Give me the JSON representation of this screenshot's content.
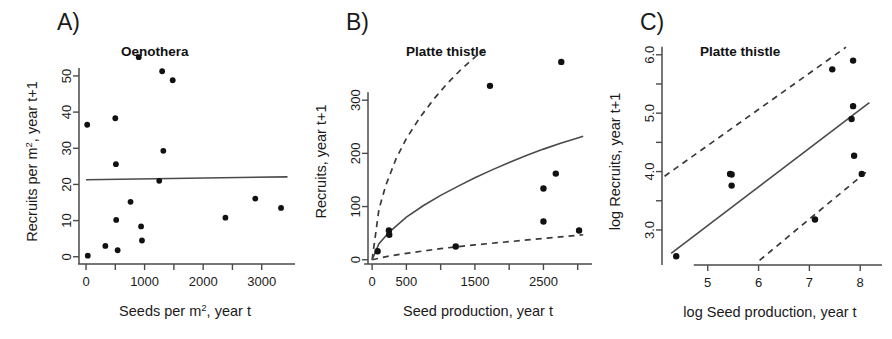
{
  "figure": {
    "name": "three-panel-recruitment-figure",
    "background": "#ffffff",
    "ink_color": "#1a1a1a"
  },
  "panels": [
    {
      "id": "A",
      "letter": "A)",
      "title": "Oenothera",
      "xlabel_pre": "Seeds per m",
      "xlabel_sup": "2",
      "xlabel_post": ", year t",
      "ylabel_pre": "Recruits per m",
      "ylabel_sup": "2",
      "ylabel_post": ", year t+1",
      "x_ticks": [
        0,
        500,
        1000,
        1500,
        2000,
        2500,
        3000
      ],
      "x_tick_labels": [
        "0",
        "",
        "1000",
        "",
        "2000",
        "",
        "3000"
      ],
      "y_ticks": [
        0,
        10,
        20,
        30,
        40,
        50
      ],
      "y_tick_labels": [
        "0",
        "10",
        "20",
        "30",
        "40",
        "50"
      ],
      "xlim": [
        -120,
        3500
      ],
      "ylim": [
        -2,
        58
      ]
    },
    {
      "id": "B",
      "letter": "B)",
      "title": "Platte thistle",
      "xlabel_pre": "Seed production, year t",
      "xlabel_sup": "",
      "xlabel_post": "",
      "ylabel_pre": "Recruits, year t+1",
      "ylabel_sup": "",
      "ylabel_post": "",
      "x_ticks": [
        0,
        500,
        1000,
        1500,
        2000,
        2500,
        3000
      ],
      "x_tick_labels": [
        "0",
        "500",
        "",
        "1500",
        "",
        "2500",
        ""
      ],
      "y_ticks": [
        0,
        100,
        200,
        300
      ],
      "y_tick_labels": [
        "0",
        "100",
        "200",
        "300"
      ],
      "xlim": [
        -60,
        3150
      ],
      "ylim": [
        -8,
        400
      ]
    },
    {
      "id": "C",
      "letter": "C)",
      "title": "Platte thistle",
      "xlabel_pre": "log Seed production, year t",
      "xlabel_sup": "",
      "xlabel_post": "",
      "ylabel_pre": "log Recruits, year t+1",
      "ylabel_sup": "",
      "ylabel_post": "",
      "x_ticks": [
        5,
        6,
        7,
        8
      ],
      "x_tick_labels": [
        "5",
        "6",
        "7",
        "8"
      ],
      "y_ticks": [
        3.0,
        3.5,
        4.0,
        4.5,
        5.0,
        5.5,
        6.0
      ],
      "y_tick_labels": [
        "3.0",
        "",
        "4.0",
        "",
        "5.0",
        "",
        "6.0"
      ],
      "xlim": [
        4.1,
        8.35
      ],
      "ylim": [
        2.4,
        6.15
      ]
    }
  ],
  "chart_data": [
    {
      "type": "scatter",
      "panel": "A",
      "title": "Oenothera",
      "xlabel": "Seeds per m2, year t",
      "ylabel": "Recruits per m2, year t+1",
      "xlim": [
        -120,
        3500
      ],
      "ylim": [
        -2,
        58
      ],
      "xticks": [
        0,
        500,
        1000,
        1500,
        2000,
        2500,
        3000
      ],
      "yticks": [
        0,
        10,
        20,
        30,
        40,
        50
      ],
      "grid": false,
      "legend": "none",
      "points": [
        {
          "x": 20,
          "y": 36.5
        },
        {
          "x": 30,
          "y": 0.3
        },
        {
          "x": 330,
          "y": 3.0
        },
        {
          "x": 500,
          "y": 38.3
        },
        {
          "x": 510,
          "y": 25.6
        },
        {
          "x": 515,
          "y": 10.2
        },
        {
          "x": 540,
          "y": 1.8
        },
        {
          "x": 760,
          "y": 15.2
        },
        {
          "x": 900,
          "y": 55.2
        },
        {
          "x": 940,
          "y": 8.4
        },
        {
          "x": 955,
          "y": 4.5
        },
        {
          "x": 1250,
          "y": 21.0
        },
        {
          "x": 1300,
          "y": 51.3
        },
        {
          "x": 1320,
          "y": 29.3
        },
        {
          "x": 1480,
          "y": 48.8
        },
        {
          "x": 2380,
          "y": 10.8
        },
        {
          "x": 2890,
          "y": 16.1
        },
        {
          "x": 3330,
          "y": 13.5
        }
      ],
      "fit_line": {
        "style": "solid",
        "label": "regression fit",
        "points": [
          {
            "x": 0,
            "y": 21.3
          },
          {
            "x": 3440,
            "y": 22.1
          }
        ]
      }
    },
    {
      "type": "scatter",
      "panel": "B",
      "title": "Platte thistle",
      "xlabel": "Seed production, year t",
      "ylabel": "Recruits, year t+1",
      "xlim": [
        -60,
        3150
      ],
      "ylim": [
        -8,
        400
      ],
      "xticks": [
        0,
        500,
        1000,
        1500,
        2000,
        2500,
        3000
      ],
      "yticks": [
        0,
        100,
        200,
        300
      ],
      "grid": false,
      "legend": "none",
      "points": [
        {
          "x": 80,
          "y": 16
        },
        {
          "x": 245,
          "y": 55
        },
        {
          "x": 250,
          "y": 47
        },
        {
          "x": 1220,
          "y": 25
        },
        {
          "x": 1720,
          "y": 327
        },
        {
          "x": 2500,
          "y": 134
        },
        {
          "x": 2500,
          "y": 72
        },
        {
          "x": 2680,
          "y": 162
        },
        {
          "x": 2760,
          "y": 372
        },
        {
          "x": 3020,
          "y": 55
        }
      ],
      "fit_line": {
        "style": "solid",
        "label": "fitted mean",
        "model": "power",
        "points": [
          {
            "x": 0,
            "y": 0
          },
          {
            "x": 100,
            "y": 30
          },
          {
            "x": 250,
            "y": 52
          },
          {
            "x": 500,
            "y": 80
          },
          {
            "x": 750,
            "y": 102
          },
          {
            "x": 1000,
            "y": 121
          },
          {
            "x": 1250,
            "y": 138
          },
          {
            "x": 1500,
            "y": 154
          },
          {
            "x": 1750,
            "y": 169
          },
          {
            "x": 2000,
            "y": 183
          },
          {
            "x": 2250,
            "y": 196
          },
          {
            "x": 2500,
            "y": 208
          },
          {
            "x": 2750,
            "y": 219
          },
          {
            "x": 3000,
            "y": 229
          },
          {
            "x": 3080,
            "y": 232
          }
        ]
      },
      "ci_upper": {
        "style": "dashed",
        "label": "upper bound",
        "points": [
          {
            "x": 0,
            "y": 0
          },
          {
            "x": 100,
            "y": 95
          },
          {
            "x": 200,
            "y": 140
          },
          {
            "x": 350,
            "y": 190
          },
          {
            "x": 500,
            "y": 228
          },
          {
            "x": 700,
            "y": 268
          },
          {
            "x": 900,
            "y": 302
          },
          {
            "x": 1100,
            "y": 332
          },
          {
            "x": 1300,
            "y": 358
          },
          {
            "x": 1500,
            "y": 381
          },
          {
            "x": 1640,
            "y": 396
          }
        ]
      },
      "ci_lower": {
        "style": "dashed",
        "label": "lower bound",
        "points": [
          {
            "x": 0,
            "y": 0
          },
          {
            "x": 250,
            "y": 7
          },
          {
            "x": 500,
            "y": 12
          },
          {
            "x": 1000,
            "y": 21
          },
          {
            "x": 1500,
            "y": 28
          },
          {
            "x": 2000,
            "y": 34
          },
          {
            "x": 2500,
            "y": 40
          },
          {
            "x": 3000,
            "y": 46
          },
          {
            "x": 3080,
            "y": 47
          }
        ]
      }
    },
    {
      "type": "scatter",
      "panel": "C",
      "title": "Platte thistle",
      "xlabel": "log Seed production, year t",
      "ylabel": "log Recruits, year t+1",
      "xlim": [
        4.1,
        8.35
      ],
      "ylim": [
        2.4,
        6.15
      ],
      "xticks": [
        5,
        6,
        7,
        8
      ],
      "yticks": [
        3.0,
        3.5,
        4.0,
        4.5,
        5.0,
        5.5,
        6.0
      ],
      "grid": false,
      "legend": "none",
      "points": [
        {
          "x": 4.38,
          "y": 2.55
        },
        {
          "x": 5.44,
          "y": 3.96
        },
        {
          "x": 5.47,
          "y": 3.95
        },
        {
          "x": 5.47,
          "y": 3.76
        },
        {
          "x": 7.11,
          "y": 3.18
        },
        {
          "x": 7.45,
          "y": 5.75
        },
        {
          "x": 7.83,
          "y": 4.9
        },
        {
          "x": 7.86,
          "y": 5.12
        },
        {
          "x": 7.86,
          "y": 5.9
        },
        {
          "x": 7.88,
          "y": 4.27
        },
        {
          "x": 8.03,
          "y": 3.96
        }
      ],
      "fit_line": {
        "style": "solid",
        "label": "regression fit",
        "points": [
          {
            "x": 4.28,
            "y": 2.6
          },
          {
            "x": 8.18,
            "y": 5.18
          }
        ]
      },
      "ci_upper": {
        "style": "dashed",
        "label": "upper bound",
        "points": [
          {
            "x": 4.15,
            "y": 3.92
          },
          {
            "x": 7.72,
            "y": 6.13
          }
        ]
      },
      "ci_lower": {
        "style": "dashed",
        "label": "lower bound",
        "points": [
          {
            "x": 6.02,
            "y": 2.48
          },
          {
            "x": 8.13,
            "y": 4.0
          }
        ]
      }
    }
  ]
}
